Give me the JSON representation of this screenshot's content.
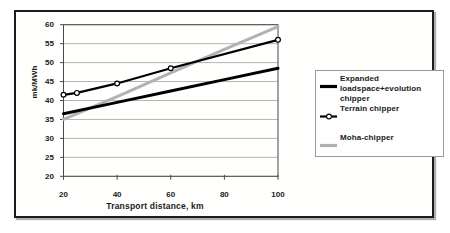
{
  "chart_data": {
    "type": "line",
    "title": "",
    "xlabel": "Transport distance, km",
    "ylabel": "mk/MWh",
    "xlim": [
      20,
      100
    ],
    "ylim": [
      20,
      60
    ],
    "x_ticks": [
      20,
      40,
      60,
      80,
      100
    ],
    "y_ticks": [
      20,
      25,
      30,
      35,
      40,
      45,
      50,
      55,
      60
    ],
    "grid": "horizontal",
    "legend_position": "right",
    "series": [
      {
        "name": "Expanded loadspace+evolution chipper",
        "x": [
          20,
          40,
          60,
          80,
          100
        ],
        "y": [
          36.5,
          39.5,
          42.5,
          45.5,
          48.5
        ],
        "color": "#000000",
        "width": 3,
        "marker": "none"
      },
      {
        "name": "Terrain chipper",
        "x": [
          20,
          25,
          40,
          60,
          100
        ],
        "y": [
          41.5,
          42,
          44.5,
          48.5,
          56
        ],
        "color": "#000000",
        "width": 2.2,
        "marker": "open-circle"
      },
      {
        "name": "Moha-chipper",
        "x": [
          20,
          40,
          60,
          80,
          100
        ],
        "y": [
          35,
          41,
          47.3,
          53.5,
          59.5
        ],
        "color": "#b2b2b2",
        "width": 3,
        "marker": "none"
      }
    ],
    "colors": {
      "axis": "#4a4a4a",
      "gridline": "#9b9b9b",
      "marker_fill": "#ffffff",
      "frame_border": "#1c1c1c",
      "legend_border": "#9a9a9a"
    }
  }
}
